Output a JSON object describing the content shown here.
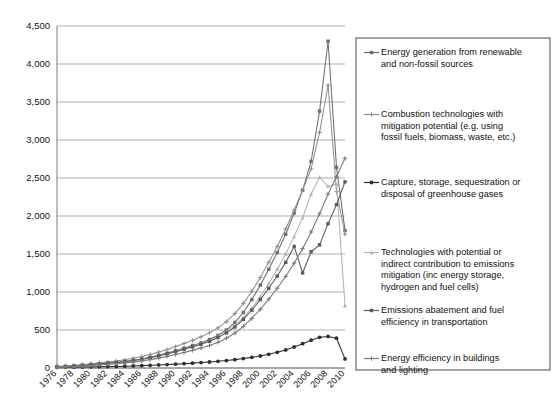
{
  "chart_data": {
    "type": "line",
    "title": "",
    "subtitle": "",
    "xlabel": "",
    "ylabel": "",
    "grid": true,
    "legend_position": "right",
    "xlim": [
      1976,
      2010
    ],
    "ylim": [
      0,
      4500
    ],
    "ytick_labels": [
      "0",
      "500",
      "1,000",
      "1,500",
      "2,000",
      "2,500",
      "3,000",
      "3,500",
      "4,000",
      "4,500"
    ],
    "ytick_values": [
      0,
      500,
      1000,
      1500,
      2000,
      2500,
      3000,
      3500,
      4000,
      4500
    ],
    "xtick_labels": [
      "1976",
      "1978",
      "1980",
      "1982",
      "1984",
      "1986",
      "1988",
      "1990",
      "1992",
      "1994",
      "1996",
      "1998",
      "2000",
      "2002",
      "2004",
      "2006",
      "2008",
      "2010"
    ],
    "x": [
      1976,
      1977,
      1978,
      1979,
      1980,
      1981,
      1982,
      1983,
      1984,
      1985,
      1986,
      1987,
      1988,
      1989,
      1990,
      1991,
      1992,
      1993,
      1994,
      1995,
      1996,
      1997,
      1998,
      1999,
      2000,
      2001,
      2002,
      2003,
      2004,
      2005,
      2006,
      2007,
      2008,
      2009,
      2010
    ],
    "series": [
      {
        "name": "Energy generation from renewable and non-fossil sources",
        "color": "#6e6e6e",
        "marker": "square",
        "values": [
          18,
          22,
          30,
          38,
          48,
          58,
          66,
          74,
          86,
          100,
          118,
          140,
          168,
          196,
          228,
          262,
          296,
          330,
          376,
          430,
          500,
          600,
          730,
          900,
          1090,
          1300,
          1520,
          1760,
          2040,
          2340,
          2720,
          3380,
          4300,
          2640,
          1810
        ]
      },
      {
        "name": "Combustion technologies with mitigation potential (e.g. using fossil fuels, biomass, waste, etc.)",
        "color": "#8f8f8f",
        "marker": "cross",
        "values": [
          20,
          26,
          34,
          44,
          56,
          68,
          80,
          92,
          108,
          128,
          150,
          178,
          210,
          244,
          282,
          322,
          364,
          410,
          462,
          528,
          610,
          716,
          850,
          1010,
          1190,
          1390,
          1600,
          1830,
          2080,
          2340,
          2620,
          3100,
          3720,
          2320,
          1760
        ]
      },
      {
        "name": "Capture, storage, sequestration or disposal of greenhouse gases",
        "color": "#2e2e2e",
        "marker": "circle",
        "values": [
          8,
          9,
          11,
          13,
          15,
          17,
          19,
          21,
          24,
          27,
          31,
          35,
          40,
          45,
          51,
          57,
          64,
          71,
          79,
          88,
          98,
          110,
          124,
          140,
          158,
          180,
          206,
          238,
          276,
          320,
          366,
          404,
          415,
          392,
          120
        ]
      },
      {
        "name": "Technologies with potential or indirect contribution to emissions mitigation (inc energy storage, hydrogen and fuel cells)",
        "color": "#b4b4b4",
        "marker": "triangle",
        "values": [
          14,
          18,
          24,
          31,
          40,
          50,
          60,
          70,
          82,
          96,
          113,
          133,
          157,
          184,
          214,
          247,
          282,
          318,
          360,
          412,
          478,
          560,
          664,
          790,
          940,
          1110,
          1300,
          1500,
          1730,
          1980,
          2290,
          2510,
          2390,
          2420,
          820
        ]
      },
      {
        "name": "Emissions abatement and fuel efficiency in transportation",
        "color": "#5a5a5a",
        "marker": "square",
        "values": [
          16,
          20,
          27,
          34,
          43,
          53,
          62,
          72,
          84,
          98,
          115,
          136,
          160,
          186,
          215,
          246,
          278,
          312,
          352,
          400,
          462,
          540,
          640,
          760,
          900,
          1050,
          1210,
          1390,
          1600,
          1250,
          1530,
          1620,
          1900,
          2150,
          2450
        ]
      },
      {
        "name": "Energy efficiency in buildings and lighting",
        "color": "#7a7a7a",
        "marker": "cross",
        "values": [
          12,
          15,
          20,
          26,
          33,
          41,
          49,
          57,
          67,
          79,
          93,
          110,
          130,
          152,
          177,
          204,
          232,
          262,
          296,
          338,
          392,
          460,
          548,
          652,
          772,
          906,
          1050,
          1205,
          1380,
          1570,
          1790,
          2030,
          2290,
          2520,
          2760
        ]
      }
    ],
    "legend_entries": [
      "Energy generation from renewable and non-fossil sources",
      "Combustion technologies with mitigation potential (e.g. using fossil fuels, biomass, waste, etc.)",
      "Capture, storage, sequestration or disposal of greenhouse gases",
      "Technologies with potential or indirect contribution to emissions mitigation (inc energy storage, hydrogen and fuel cells)",
      "Emissions abatement and fuel efficiency in transportation",
      "Energy efficiency in buildings and lighting"
    ],
    "legend_lines": [
      [
        "Energy generation from renewable",
        "and non-fossil sources"
      ],
      [
        "Combustion technologies with",
        "mitigation potential (e.g. using",
        "fossil fuels, biomass, waste, etc.)"
      ],
      [
        "Capture, storage, sequestration or",
        "disposal of greenhouse gases"
      ],
      [
        "Technologies with potential or",
        "indirect contribution to emissions",
        "mitigation (inc energy storage,",
        "hydrogen and fuel cells)"
      ],
      [
        "Emissions abatement and fuel",
        "efficiency in transportation"
      ],
      [
        "Energy efficiency in buildings",
        "and lighting"
      ]
    ]
  }
}
